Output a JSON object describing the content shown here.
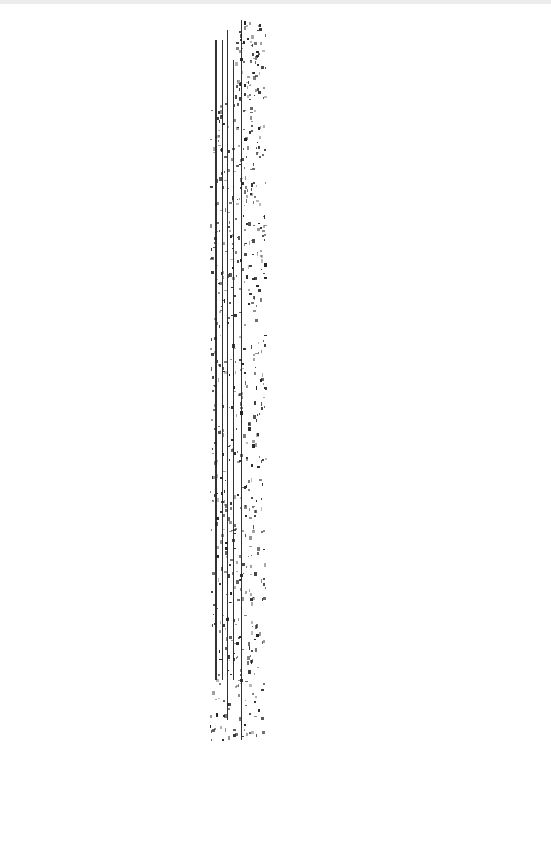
{
  "document": {
    "description": "Degraded scanned page; no legible text",
    "background": "#ffffff",
    "artifact_color": "#222222",
    "strip": {
      "x": 212,
      "y": 20,
      "width": 50,
      "height": 725
    }
  }
}
